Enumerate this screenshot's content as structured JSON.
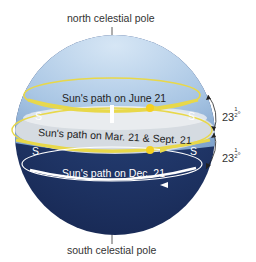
{
  "labels": {
    "north_pole": "north celestial pole",
    "south_pole": "south celestial pole",
    "june_path": "Sun's path on June 21",
    "equinox_path": "Sun's path on Mar. 21 & Sept. 21",
    "dec_path": "Sun's path on Dec. 21",
    "s_left_upper": "S",
    "s_right_upper": "S",
    "s_left_lower": "S",
    "s_right_lower": "S",
    "angle_upper_whole": "23",
    "angle_upper_frac_num": "1",
    "angle_upper_frac_den": "2",
    "angle_upper_deg": "°",
    "angle_lower_whole": "23",
    "angle_lower_frac_num": "1",
    "angle_lower_frac_den": "2",
    "angle_lower_deg": "°"
  },
  "colors": {
    "sky_upper": "#a9c6e4",
    "sky_lower": "#1f3566",
    "sun_path": "#e8d84a",
    "dec_path": "#ffffff",
    "horizon_plane": "#d9dde2"
  }
}
